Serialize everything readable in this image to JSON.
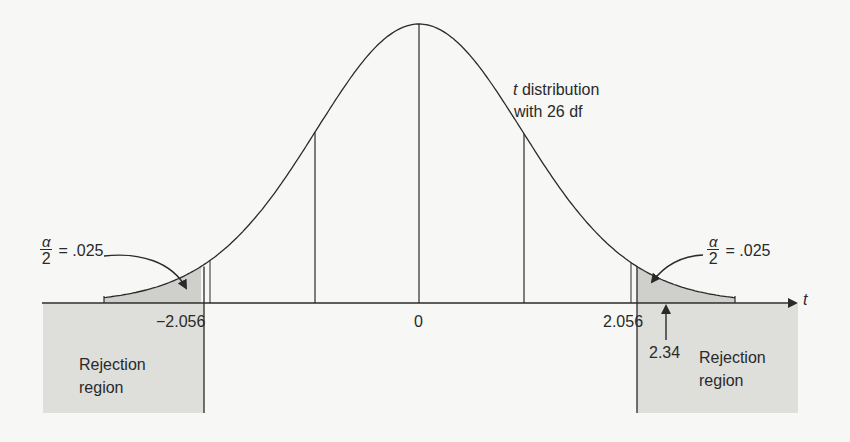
{
  "chart_data": {
    "type": "area",
    "title": "t distribution with 26 df",
    "distribution": "t",
    "degrees_of_freedom": 26,
    "xlabel": "t",
    "ylabel": "",
    "x_ticks": [
      {
        "value": -2.056,
        "label": "−2.056"
      },
      {
        "value": 0,
        "label": "0"
      },
      {
        "value": 2.056,
        "label": "2.056"
      }
    ],
    "critical_values": [
      -2.056,
      2.056
    ],
    "test_statistic": {
      "value": 2.34,
      "label": "2.34"
    },
    "tail_areas": [
      {
        "side": "left",
        "alpha_over_2": 0.025,
        "label": "α/2 = .025"
      },
      {
        "side": "right",
        "alpha_over_2": 0.025,
        "label": "α/2 = .025"
      }
    ],
    "rejection_regions": [
      {
        "side": "left",
        "range": "t < -2.056",
        "label": "Rejection region"
      },
      {
        "side": "right",
        "range": "t > 2.056",
        "label": "Rejection region"
      }
    ],
    "grid": false,
    "legend": null
  },
  "colors": {
    "background": "#f7f7f5",
    "ink": "#2a2a2a",
    "tail_shade": "#cfcfcc",
    "region_shade": "#dededb"
  },
  "labels": {
    "curve_title_italic": "t",
    "curve_title_line1": " distribution",
    "curve_title_line2": "with 26 df",
    "axis_var": "t",
    "tick_left": "−2.056",
    "tick_zero": "0",
    "tick_right": "2.056",
    "test_stat": "2.34",
    "alpha_num": "α",
    "alpha_den": "2",
    "alpha_rest": "= .025",
    "region_left_line1": "Rejection",
    "region_left_line2": "region",
    "region_right_line1": "Rejection",
    "region_right_line2": "region"
  }
}
